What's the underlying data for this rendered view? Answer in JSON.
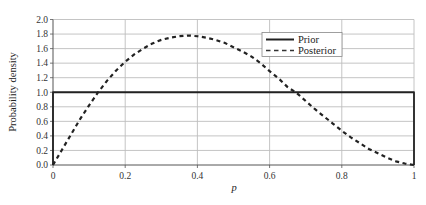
{
  "chart_data": {
    "type": "line",
    "title": "",
    "xlabel": "p",
    "ylabel": "Probability density",
    "xlim": [
      0,
      1
    ],
    "ylim": [
      0,
      2.0
    ],
    "grid": true,
    "legend_position": "upper right (inside plot)",
    "x_ticks": [
      "0",
      "0.2",
      "0.4",
      "0.6",
      "0.8",
      "1"
    ],
    "y_ticks": [
      "0.0",
      "0.2",
      "0.4",
      "0.6",
      "0.8",
      "1.0",
      "1.2",
      "1.4",
      "1.6",
      "1.8",
      "2.0"
    ],
    "series": [
      {
        "name": "Prior",
        "style": "solid",
        "color": "#222222",
        "x": [
          0,
          0,
          1,
          1
        ],
        "y": [
          0,
          1.0,
          1.0,
          0
        ]
      },
      {
        "name": "Posterior",
        "style": "dashed",
        "color": "#222222",
        "x": [
          0,
          0.025,
          0.05,
          0.075,
          0.1,
          0.125,
          0.15,
          0.175,
          0.2,
          0.225,
          0.25,
          0.275,
          0.3,
          0.325,
          0.35,
          0.375,
          0.4,
          0.425,
          0.45,
          0.475,
          0.5,
          0.525,
          0.55,
          0.575,
          0.6,
          0.625,
          0.65,
          0.675,
          0.7,
          0.725,
          0.75,
          0.775,
          0.8,
          0.825,
          0.85,
          0.875,
          0.9,
          0.925,
          0.95,
          0.975,
          1.0
        ],
        "y": [
          0.0,
          0.21,
          0.42,
          0.63,
          0.82,
          1.0,
          1.16,
          1.3,
          1.42,
          1.52,
          1.6,
          1.67,
          1.72,
          1.75,
          1.77,
          1.78,
          1.77,
          1.75,
          1.72,
          1.68,
          1.62,
          1.56,
          1.49,
          1.4,
          1.29,
          1.19,
          1.07,
          0.99,
          0.88,
          0.77,
          0.67,
          0.57,
          0.47,
          0.38,
          0.3,
          0.22,
          0.16,
          0.1,
          0.05,
          0.02,
          0.0
        ]
      }
    ]
  }
}
